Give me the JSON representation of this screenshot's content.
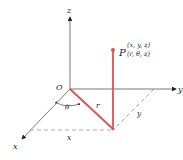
{
  "diagram": {
    "axes": {
      "x_label": "x",
      "y_label": "y",
      "z_label": "z",
      "origin_label": "O"
    },
    "point": {
      "label": "P",
      "cartesian": "(x, y, z)",
      "cylindrical": "(r, θ, z)"
    },
    "segments": {
      "r_label": "r",
      "theta_label": "θ",
      "x_label": "x",
      "y_label": "y"
    },
    "colors": {
      "axis": "#555555",
      "highlight": "#e0524a",
      "dashed": "#999999"
    }
  }
}
